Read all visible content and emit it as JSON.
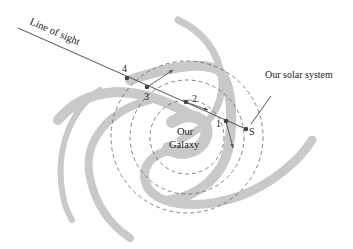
{
  "diagram": {
    "labels": {
      "line_of_sight": "Line of sight",
      "solar_system": "Our solar system",
      "galaxy_line1": "Our",
      "galaxy_line2": "Galaxy",
      "point_1": "1",
      "point_2": "2",
      "point_3": "3",
      "point_4": "4",
      "point_s": "S"
    },
    "colors": {
      "spiral_arm": "#c8c8c8",
      "line": "#555555",
      "dashed_circle": "#666666",
      "point": "#444444",
      "text": "#222222"
    }
  }
}
